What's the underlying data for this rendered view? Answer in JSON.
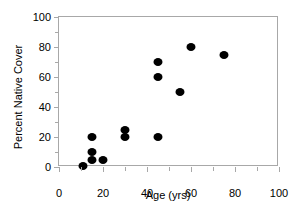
{
  "chart_data": {
    "type": "scatter",
    "title": "",
    "xlabel": "Age (yrs)",
    "ylabel": "Percent Native Cover",
    "xlim": [
      0,
      100
    ],
    "ylim": [
      0,
      100
    ],
    "xticks": [
      0,
      20,
      40,
      60,
      80,
      100
    ],
    "yticks": [
      0,
      20,
      40,
      60,
      80,
      100
    ],
    "xticklabels": [
      "0",
      "20",
      "40",
      "60",
      "80",
      "100"
    ],
    "yticklabels": [
      "0",
      "20",
      "40",
      "60",
      "80",
      "100"
    ],
    "xminor_ticks": [
      10,
      30,
      50,
      70,
      90
    ],
    "yminor_ticks": [
      10,
      30,
      50,
      70,
      90
    ],
    "grid": false,
    "legend": false,
    "marker": "filled-circle",
    "marker_color": "#000000",
    "frame": true,
    "points": [
      {
        "x": 11,
        "y": 1
      },
      {
        "x": 15,
        "y": 5
      },
      {
        "x": 15,
        "y": 10
      },
      {
        "x": 15,
        "y": 20
      },
      {
        "x": 20,
        "y": 5
      },
      {
        "x": 30,
        "y": 20
      },
      {
        "x": 30,
        "y": 25
      },
      {
        "x": 45,
        "y": 20
      },
      {
        "x": 45,
        "y": 60
      },
      {
        "x": 45,
        "y": 70
      },
      {
        "x": 55,
        "y": 50
      },
      {
        "x": 60,
        "y": 80
      },
      {
        "x": 75,
        "y": 75
      }
    ]
  }
}
